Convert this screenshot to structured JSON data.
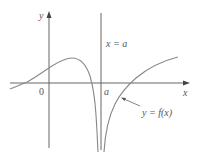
{
  "diagram": {
    "labels": {
      "y_axis": "y",
      "x_axis": "x",
      "origin": "0",
      "asymptote_point": "a",
      "asymptote_equation": "x = a",
      "curve_label": "y = f(x)"
    },
    "colors": {
      "axis": "#666666",
      "curve": "#888888",
      "text": "#555555"
    }
  }
}
